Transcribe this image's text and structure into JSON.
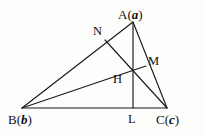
{
  "figure": {
    "type": "geometry-diagram",
    "background_color": "#fdfdfc",
    "line_color": "#1a1a1a",
    "text_color": "#111111",
    "width": 203,
    "height": 135,
    "labels": {
      "A": {
        "text": "A",
        "vector": "a",
        "open_paren": "(",
        "close_paren": ")",
        "x": 118,
        "y": 8
      },
      "B": {
        "text": "B",
        "vector": "b",
        "open_paren": "(",
        "close_paren": ")",
        "x": 8,
        "y": 113
      },
      "C": {
        "text": "C",
        "vector": "c",
        "open_paren": "(",
        "close_paren": ")",
        "x": 156,
        "y": 113
      },
      "N": {
        "text": "N",
        "x": 93,
        "y": 25
      },
      "M": {
        "text": "M",
        "x": 148,
        "y": 55
      },
      "H": {
        "text": "H",
        "x": 113,
        "y": 73
      },
      "L": {
        "text": "L",
        "x": 128,
        "y": 113
      }
    },
    "points": {
      "A": {
        "x": 133,
        "y": 22
      },
      "B": {
        "x": 22,
        "y": 108
      },
      "C": {
        "x": 167,
        "y": 108
      },
      "L": {
        "x": 133,
        "y": 108
      },
      "M": {
        "x": 146,
        "y": 66
      },
      "N": {
        "x": 105,
        "y": 40
      },
      "H": {
        "x": 133,
        "y": 72
      }
    },
    "segments": [
      {
        "name": "side-AB",
        "from": "A",
        "to": "B"
      },
      {
        "name": "side-BC",
        "from": "B",
        "to": "C"
      },
      {
        "name": "side-CA",
        "from": "C",
        "to": "A"
      },
      {
        "name": "altitude-AL",
        "from": "A",
        "to": "L"
      },
      {
        "name": "altitude-BM",
        "from": "B",
        "to": "M"
      },
      {
        "name": "altitude-CN",
        "from": "C",
        "to": "N"
      }
    ]
  }
}
